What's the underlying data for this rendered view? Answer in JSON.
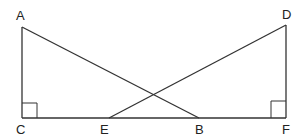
{
  "diagram": {
    "type": "geometry",
    "points": {
      "A": {
        "label": "A",
        "x": 22,
        "y": 27,
        "lx": 22,
        "ly": 19
      },
      "C": {
        "label": "C",
        "x": 22,
        "y": 118,
        "lx": 21,
        "ly": 134
      },
      "E": {
        "label": "E",
        "x": 109,
        "y": 118,
        "lx": 105,
        "ly": 134
      },
      "B": {
        "label": "B",
        "x": 199,
        "y": 118,
        "lx": 199,
        "ly": 134
      },
      "F": {
        "label": "F",
        "x": 286,
        "y": 118,
        "lx": 287,
        "ly": 134
      },
      "D": {
        "label": "D",
        "x": 286,
        "y": 25,
        "lx": 287,
        "ly": 18
      }
    },
    "segments": [
      "AC",
      "CF",
      "AB",
      "DE",
      "DF"
    ],
    "right_angles": [
      "C",
      "F"
    ],
    "stroke_color": "#333333"
  }
}
